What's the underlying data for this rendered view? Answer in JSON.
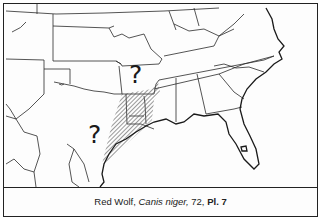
{
  "map": {
    "region": "Southeastern United States",
    "range_fill": "diagonal-hatch",
    "question_marks": [
      {
        "label": "?",
        "location": "north (Arkansas/Missouri)"
      },
      {
        "label": "?",
        "location": "west (Texas)"
      }
    ],
    "colors": {
      "ink": "#222222",
      "paper": "#fdfdfd",
      "hatch": "#555555"
    }
  },
  "caption": {
    "common_name": "Red Wolf,",
    "scientific_name": "Canis niger,",
    "page": "72,",
    "plate": "Pl. 7"
  }
}
